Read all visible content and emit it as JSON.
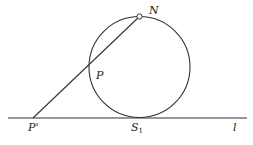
{
  "diagram": {
    "type": "stereographic-projection",
    "labels": {
      "N": "N",
      "P": "P",
      "P_prime": "P'",
      "S": "S",
      "S_sub": "1",
      "l": "l"
    },
    "elements": {
      "circle": {
        "cx": 139.5,
        "cy": 67,
        "r": 50.5
      },
      "north_point": {
        "x": 139.5,
        "y": 16.5,
        "r": 2.5
      },
      "line_l": {
        "x1": 8,
        "y1": 118,
        "x2": 247,
        "y2": 118
      },
      "projection_line": {
        "x1": 33,
        "y1": 118,
        "x2": 139.5,
        "y2": 16.5
      }
    },
    "colors": {
      "stroke": "#333333",
      "background": "#ffffff"
    }
  }
}
